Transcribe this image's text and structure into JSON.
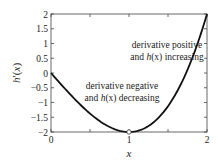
{
  "chart_data": {
    "type": "line",
    "title": "",
    "xlabel": "x",
    "ylabel": "h'(x)",
    "xlim": [
      0,
      2
    ],
    "ylim": [
      -2,
      2
    ],
    "grid": false,
    "x_ticks": [
      "0",
      "1",
      "2"
    ],
    "y_ticks": [
      "2",
      "1.5",
      "1",
      "0.5",
      "0",
      "−0.5",
      "−1",
      "−1.5",
      "−2"
    ],
    "series": [
      {
        "name": "h'(x)",
        "x": [
          0,
          0.25,
          0.5,
          0.75,
          1.0,
          1.25,
          1.5,
          1.75,
          2.0
        ],
        "values": [
          0,
          -0.73,
          -1.38,
          -1.83,
          -2.0,
          -1.8,
          -1.13,
          0.11,
          2.0
        ]
      }
    ],
    "annotations": [
      {
        "line1": "derivative positive",
        "line2_prefix": "and ",
        "line2_italic": "h",
        "line2_arg": "(x)",
        "line2_suffix": " increasing"
      },
      {
        "line1": "derivative negative",
        "line2_prefix": "and ",
        "line2_italic": "h",
        "line2_arg": "(x)",
        "line2_suffix": " decreasing"
      }
    ],
    "marker": {
      "x": 1,
      "y": -2,
      "shape": "open-circle"
    },
    "colors": {
      "line": "#111111",
      "axes": "#444444",
      "text": "#222222"
    }
  }
}
